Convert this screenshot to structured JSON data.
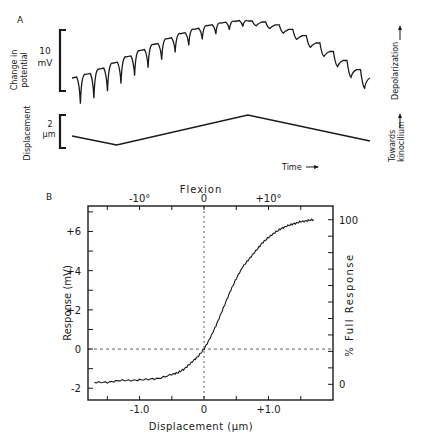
{
  "panel_a": {
    "label": "A",
    "potential_axis_label_line1": "Change in",
    "potential_axis_label_line2": "potential",
    "potential_scale_value": "10",
    "potential_scale_unit": "mV",
    "displacement_axis_label": "Displacement",
    "displacement_scale_value": "2",
    "displacement_scale_unit": "μm",
    "time_label": "Time",
    "right_label_depolarization": "Depolarization",
    "right_label_towards_line1": "Towards",
    "right_label_towards_line2": "kinocilium",
    "displacement_trace": {
      "description": "triangular displacement stimulus",
      "points_rel": [
        [
          0,
          0.3
        ],
        [
          0.15,
          0.0
        ],
        [
          0.59,
          1.0
        ],
        [
          1.0,
          0.13
        ]
      ]
    },
    "potential_trace": {
      "description": "receptor potential with adaptation transients per step",
      "step_count": 22
    }
  },
  "panel_b": {
    "label": "B",
    "chart_data": {
      "type": "line",
      "title": "",
      "xlabel": "Displacement (μm)",
      "ylabel": "Response (mV)",
      "top_axis_label": "Flexion",
      "right_axis_label": "% Full Response",
      "xlim": [
        -1.8,
        2.0
      ],
      "ylim": [
        -2.6,
        7.3
      ],
      "x_ticks": [
        -1.0,
        0,
        1.0
      ],
      "x_tick_labels": [
        "-1.0",
        "0",
        "+1.0"
      ],
      "y_ticks": [
        -2,
        0,
        2,
        4,
        6
      ],
      "y_tick_labels": [
        "-2",
        "0",
        "+2",
        "+4",
        "+6"
      ],
      "top_ticks_deg": [
        -10,
        0,
        10
      ],
      "top_tick_labels": [
        "-10°",
        "0",
        "+10°"
      ],
      "right_ticks_pct": [
        0,
        100
      ],
      "right_tick_labels": [
        "0",
        "100"
      ],
      "right_axis_range_mV": [
        -1.8,
        6.6
      ],
      "reference_lines": {
        "x": 0,
        "y": 0
      },
      "series": [
        {
          "name": "response",
          "x": [
            -1.7,
            -1.5,
            -1.3,
            -1.1,
            -0.9,
            -0.7,
            -0.5,
            -0.4,
            -0.3,
            -0.2,
            -0.1,
            0.0,
            0.1,
            0.2,
            0.3,
            0.4,
            0.5,
            0.6,
            0.7,
            0.8,
            0.9,
            1.0,
            1.1,
            1.2,
            1.3,
            1.4,
            1.5,
            1.6,
            1.7
          ],
          "y": [
            -1.7,
            -1.7,
            -1.6,
            -1.6,
            -1.55,
            -1.5,
            -1.3,
            -1.2,
            -1.0,
            -0.7,
            -0.4,
            0.0,
            0.6,
            1.3,
            2.1,
            2.9,
            3.6,
            4.2,
            4.6,
            5.0,
            5.4,
            5.7,
            5.95,
            6.15,
            6.3,
            6.4,
            6.5,
            6.55,
            6.6
          ]
        }
      ]
    }
  }
}
